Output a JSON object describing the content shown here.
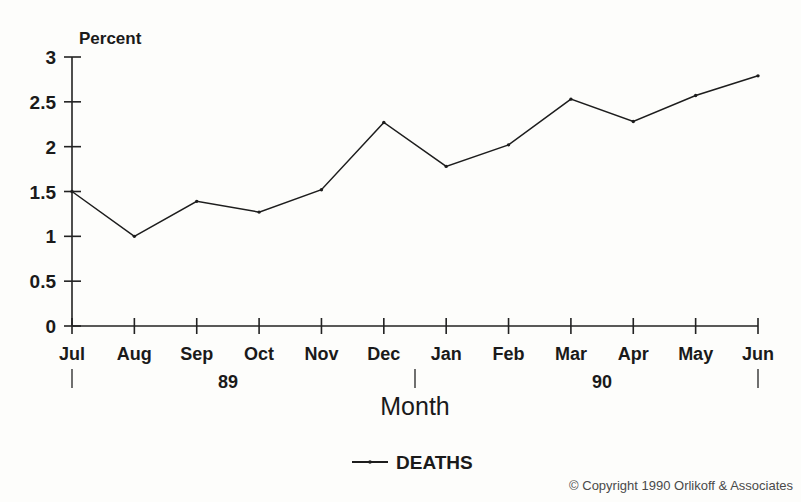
{
  "chart_data": {
    "type": "line",
    "title": "",
    "xlabel": "Month",
    "ylabel": "Percent",
    "categories": [
      "Jul",
      "Aug",
      "Sep",
      "Oct",
      "Nov",
      "Dec",
      "Jan",
      "Feb",
      "Mar",
      "Apr",
      "May",
      "Jun"
    ],
    "series": [
      {
        "name": "DEATHS",
        "values": [
          1.5,
          1.0,
          1.39,
          1.27,
          1.52,
          2.27,
          1.78,
          2.02,
          2.53,
          2.28,
          2.57,
          2.79
        ]
      }
    ],
    "ylim": [
      0,
      3
    ],
    "ytick_labels": [
      "0",
      "0.5",
      "1",
      "1.5",
      "2",
      "2.5",
      "3"
    ],
    "ytick_values": [
      0,
      0.5,
      1,
      1.5,
      2,
      2.5,
      3
    ],
    "grid": false,
    "legend_position": "bottom-center",
    "year_groups": [
      {
        "label": "89",
        "start_index": 0,
        "end_index": 5
      },
      {
        "label": "90",
        "start_index": 6,
        "end_index": 11
      }
    ],
    "line_color": "#1d1d1d",
    "background_color": "#fdfdfb"
  },
  "labels": {
    "y_axis_title": "Percent",
    "x_axis_title": "Month"
  },
  "legend": {
    "entries": [
      {
        "label": "DEATHS",
        "marker": "line-with-dot"
      }
    ]
  },
  "footer": {
    "copyright": "© Copyright 1990 Orlikoff & Associates"
  }
}
